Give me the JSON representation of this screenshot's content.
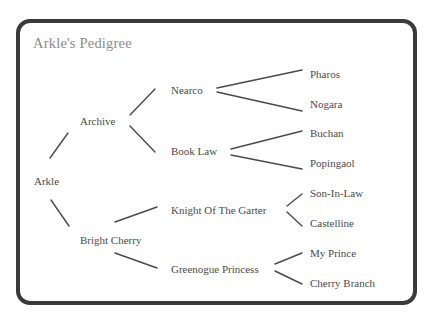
{
  "diagram": {
    "title": "Arkle's Pedigree",
    "colors": {
      "border": "#3a3a3a",
      "title": "#8a8a8a",
      "text": "#4a4a4a",
      "lines": "#4a4a4a",
      "background": "#ffffff"
    },
    "tree": {
      "name": "Arkle",
      "sire": {
        "name": "Archive",
        "sire": {
          "name": "Nearco",
          "sire": "Pharos",
          "dam": "Nogara"
        },
        "dam": {
          "name": "Book Law",
          "sire": "Buchan",
          "dam": "Popingaol"
        }
      },
      "dam": {
        "name": "Bright Cherry",
        "sire": {
          "name": "Knight Of The Garter",
          "sire": "Son-In-Law",
          "dam": "Castelline"
        },
        "dam": {
          "name": "Greenogue Princess",
          "sire": "My Prince",
          "dam": "Cherry Branch"
        }
      }
    },
    "nodes": [
      {
        "id": "arkle",
        "label": "Arkle",
        "generation": 0,
        "x": 34,
        "y": 181
      },
      {
        "id": "archive",
        "label": "Archive",
        "generation": 1,
        "x": 80,
        "y": 121
      },
      {
        "id": "bright-cherry",
        "label": "Bright Cherry",
        "generation": 1,
        "x": 80,
        "y": 240
      },
      {
        "id": "nearco",
        "label": "Nearco",
        "generation": 2,
        "x": 171,
        "y": 90
      },
      {
        "id": "book-law",
        "label": "Book Law",
        "generation": 2,
        "x": 171,
        "y": 151
      },
      {
        "id": "knight-of-the-garter",
        "label": "Knight Of The Garter",
        "generation": 2,
        "x": 171,
        "y": 210
      },
      {
        "id": "greenogue-princess",
        "label": "Greenogue Princess",
        "generation": 2,
        "x": 171,
        "y": 269
      },
      {
        "id": "pharos",
        "label": "Pharos",
        "generation": 3,
        "x": 310,
        "y": 74
      },
      {
        "id": "nogara",
        "label": "Nogara",
        "generation": 3,
        "x": 310,
        "y": 104
      },
      {
        "id": "buchan",
        "label": "Buchan",
        "generation": 3,
        "x": 310,
        "y": 133
      },
      {
        "id": "popingaol",
        "label": "Popingaol",
        "generation": 3,
        "x": 310,
        "y": 163
      },
      {
        "id": "son-in-law",
        "label": "Son-In-Law",
        "generation": 3,
        "x": 310,
        "y": 193
      },
      {
        "id": "castelline",
        "label": "Castelline",
        "generation": 3,
        "x": 310,
        "y": 223
      },
      {
        "id": "my-prince",
        "label": "My Prince",
        "generation": 3,
        "x": 310,
        "y": 253
      },
      {
        "id": "cherry-branch",
        "label": "Cherry Branch",
        "generation": 3,
        "x": 310,
        "y": 283
      }
    ],
    "edges": [
      {
        "from": "arkle",
        "to": "archive",
        "x1": 50,
        "y1": 158,
        "x2": 68,
        "y2": 133
      },
      {
        "from": "arkle",
        "to": "bright-cherry",
        "x1": 51,
        "y1": 200,
        "x2": 69,
        "y2": 226
      },
      {
        "from": "archive",
        "to": "nearco",
        "x1": 130,
        "y1": 115,
        "x2": 155,
        "y2": 89
      },
      {
        "from": "archive",
        "to": "book-law",
        "x1": 130,
        "y1": 126,
        "x2": 155,
        "y2": 152
      },
      {
        "from": "bright-cherry",
        "to": "knight-of-the-garter",
        "x1": 115,
        "y1": 222,
        "x2": 157,
        "y2": 207
      },
      {
        "from": "bright-cherry",
        "to": "greenogue-princess",
        "x1": 115,
        "y1": 253,
        "x2": 157,
        "y2": 268
      },
      {
        "from": "nearco",
        "to": "pharos",
        "x1": 217,
        "y1": 88,
        "x2": 302,
        "y2": 70
      },
      {
        "from": "nearco",
        "to": "nogara",
        "x1": 217,
        "y1": 92,
        "x2": 302,
        "y2": 111
      },
      {
        "from": "book-law",
        "to": "buchan",
        "x1": 231,
        "y1": 149,
        "x2": 302,
        "y2": 131
      },
      {
        "from": "book-law",
        "to": "popingaol",
        "x1": 231,
        "y1": 155,
        "x2": 302,
        "y2": 169
      },
      {
        "from": "knight-of-the-garter",
        "to": "son-in-law",
        "x1": 287,
        "y1": 206,
        "x2": 302,
        "y2": 194
      },
      {
        "from": "knight-of-the-garter",
        "to": "castelline",
        "x1": 287,
        "y1": 212,
        "x2": 302,
        "y2": 226
      },
      {
        "from": "greenogue-princess",
        "to": "my-prince",
        "x1": 275,
        "y1": 264,
        "x2": 302,
        "y2": 253
      },
      {
        "from": "greenogue-princess",
        "to": "cherry-branch",
        "x1": 275,
        "y1": 271,
        "x2": 302,
        "y2": 284
      }
    ]
  }
}
